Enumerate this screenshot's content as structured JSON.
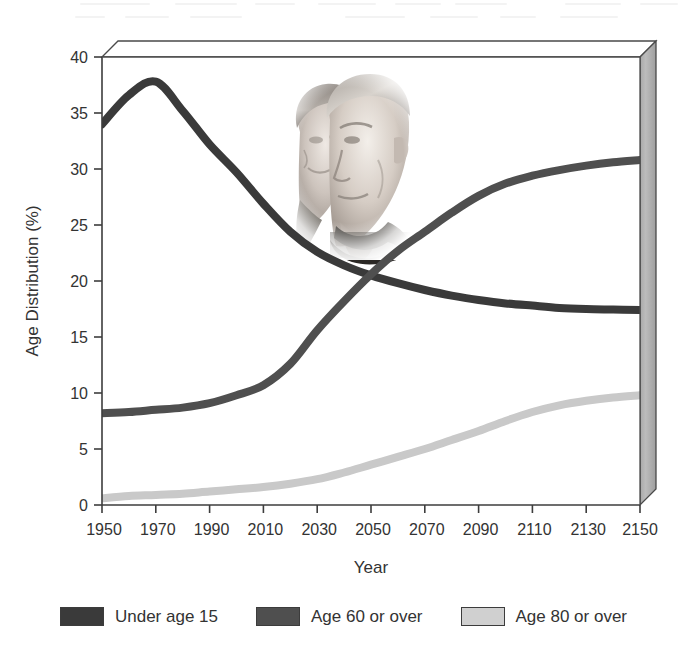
{
  "chart_data": {
    "type": "line",
    "title": "",
    "xlabel": "Year",
    "ylabel": "Age Distribution (%)",
    "xlim": [
      1950,
      2150
    ],
    "ylim": [
      0,
      40
    ],
    "grid": false,
    "legend_position": "bottom",
    "x_ticks": [
      "1950",
      "1970",
      "1990",
      "2010",
      "2030",
      "2050",
      "2070",
      "2090",
      "2110",
      "2130",
      "2150"
    ],
    "y_ticks": [
      "0",
      "5",
      "10",
      "15",
      "20",
      "25",
      "30",
      "35",
      "40"
    ],
    "x": [
      1950,
      1960,
      1970,
      1980,
      1990,
      2000,
      2010,
      2020,
      2030,
      2040,
      2050,
      2060,
      2070,
      2080,
      2090,
      2100,
      2110,
      2120,
      2130,
      2140,
      2150
    ],
    "series": [
      {
        "name": "Under age 15",
        "color": "#3a3a3a",
        "values": [
          34.0,
          36.6,
          37.8,
          35.2,
          32.2,
          29.7,
          26.9,
          24.4,
          22.6,
          21.4,
          20.5,
          19.8,
          19.2,
          18.7,
          18.3,
          18.0,
          17.8,
          17.6,
          17.5,
          17.45,
          17.4
        ]
      },
      {
        "name": "Age 60 or over",
        "color": "#4f4f4f",
        "values": [
          8.2,
          8.3,
          8.5,
          8.7,
          9.1,
          9.8,
          10.7,
          12.6,
          15.6,
          18.2,
          20.6,
          22.7,
          24.4,
          26.1,
          27.6,
          28.7,
          29.4,
          29.9,
          30.3,
          30.6,
          30.8
        ]
      },
      {
        "name": "Age 80 or over",
        "color": "#c9c9c9",
        "values": [
          0.6,
          0.8,
          0.9,
          1.0,
          1.2,
          1.4,
          1.6,
          1.9,
          2.3,
          2.9,
          3.6,
          4.3,
          5.0,
          5.8,
          6.6,
          7.5,
          8.3,
          8.9,
          9.3,
          9.6,
          9.8
        ]
      }
    ]
  },
  "axes": {
    "y_title": "Age Distribution (%)",
    "x_title": "Year",
    "y_ticks": [
      "40",
      "35",
      "30",
      "25",
      "20",
      "15",
      "10",
      "5",
      "0"
    ],
    "x_ticks": [
      "1950",
      "1970",
      "1990",
      "2010",
      "2030",
      "2050",
      "2070",
      "2090",
      "2110",
      "2130",
      "2150"
    ]
  },
  "legend": {
    "items": [
      {
        "label": "Under age 15",
        "color": "#3a3a3a"
      },
      {
        "label": "Age 60 or over",
        "color": "#4f4f4f"
      },
      {
        "label": "Age 80 or over",
        "color": "#d0d0d0"
      }
    ]
  },
  "photo": {
    "alt": "Photograph of an elderly couple"
  },
  "colors": {
    "frame_line": "#4a4a4a",
    "side_panel": "#b0b0b0",
    "side_panel_dark": "#9a9a9a",
    "background": "#ffffff",
    "text": "#333333"
  }
}
